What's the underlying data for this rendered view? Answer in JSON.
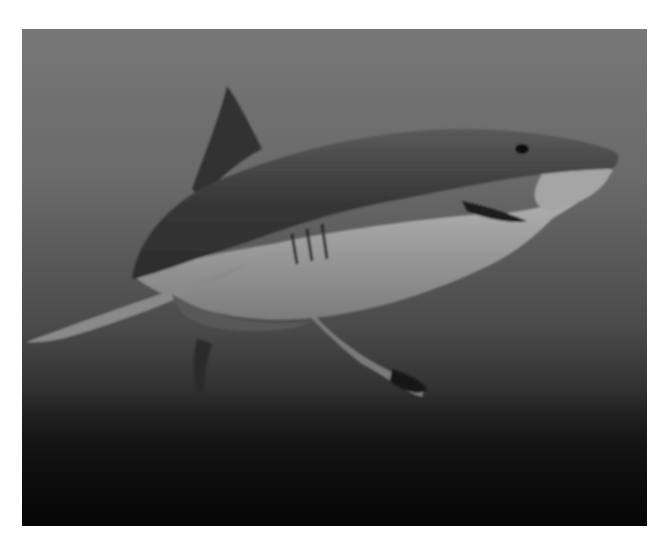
{
  "image": {
    "subject": "great white shark swimming underwater",
    "style": "grayscale photograph",
    "colors": {
      "water_top": "#777777",
      "water_mid": "#4a4a4a",
      "seabed": "#0c0c0c",
      "shark_back": "#3a3a3a",
      "shark_belly": "#b5b5b5",
      "border": "#ffffff"
    }
  }
}
